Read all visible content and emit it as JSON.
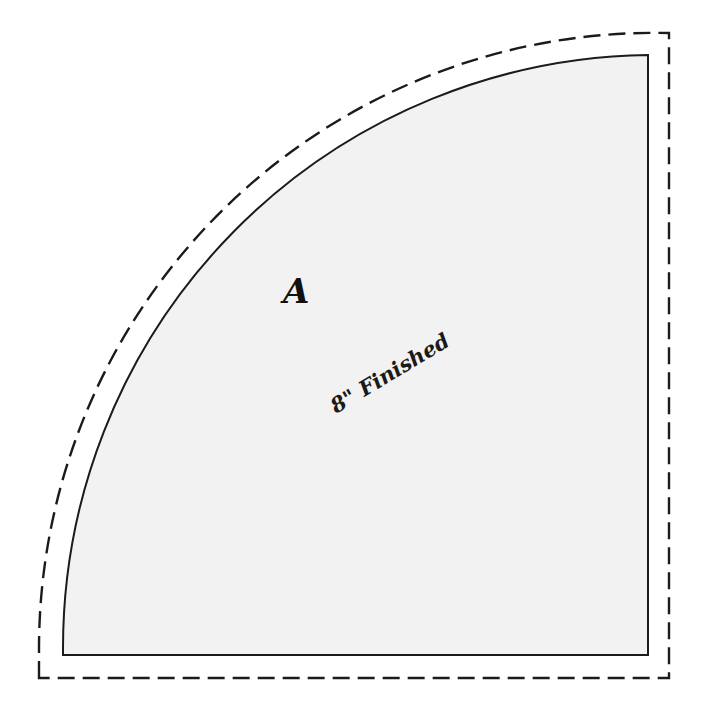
{
  "document": {
    "title": "Quilt Template Piece A",
    "type": "sewing-pattern-template",
    "background_color": "#ffffff"
  },
  "template_piece": {
    "letter_label": "A",
    "size_label": "8\" Finished",
    "shape": "quarter-circle",
    "fill_color": "#f2f2f2",
    "line_color": "#1b1b1b",
    "finished_line_style": "solid",
    "cut_line_style": "dashed",
    "seam_allowance_px": 23
  },
  "geometry": {
    "center_x": 648,
    "center_y": 655,
    "finished_radius": 593,
    "cut_radius": 616,
    "finished": {
      "corner_bottom_left_x": 63,
      "corner_bottom_left_y": 655,
      "corner_bottom_right_x": 648,
      "corner_bottom_right_y": 655,
      "corner_top_right_x": 648,
      "corner_top_right_y": 55
    },
    "cut": {
      "corner_bottom_left_x": 39,
      "corner_bottom_left_y": 678,
      "corner_bottom_right_x": 669,
      "corner_bottom_right_y": 678,
      "corner_top_right_x": 669,
      "corner_top_right_y": 33
    },
    "letter_position": {
      "x": 283,
      "y": 303
    },
    "size_label_position": {
      "x": 336,
      "y": 414,
      "rotation_deg": -31
    }
  }
}
